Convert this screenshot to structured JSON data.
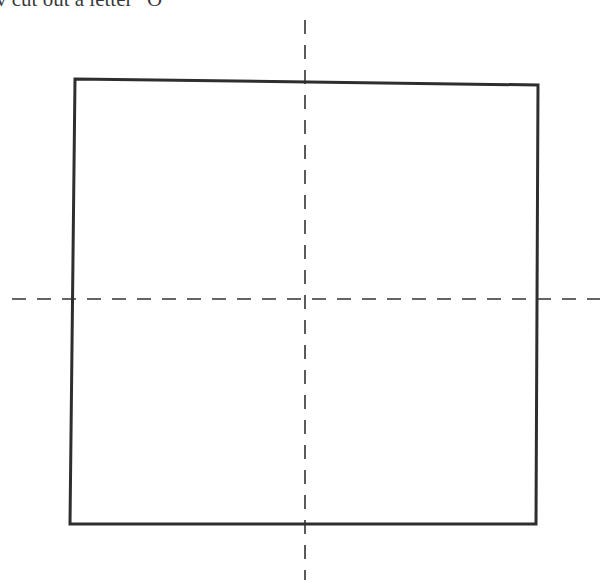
{
  "caption": {
    "text": "v cut out a letter “O”"
  },
  "diagram": {
    "square": {
      "corners": {
        "tl": [
          75,
          79
        ],
        "tr": [
          538,
          85
        ],
        "br": [
          536,
          524
        ],
        "bl": [
          70,
          524
        ]
      },
      "stroke": "#2e2e2e",
      "stroke_width": 3
    },
    "fold_lines": {
      "vertical": {
        "x": 305,
        "y1": 20,
        "y2": 580,
        "style": "dashed"
      },
      "horizontal": {
        "y": 299,
        "x1": 12,
        "x2": 600,
        "style": "dashed"
      },
      "color": "#333333"
    }
  }
}
